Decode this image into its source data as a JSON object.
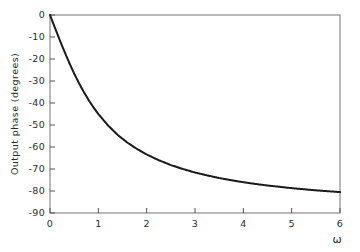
{
  "chart_data": {
    "type": "line",
    "title": "",
    "subtitle": "",
    "xlabel": "ω",
    "ylabel": "Output phase (degrees)",
    "xlim": [
      0,
      6
    ],
    "ylim": [
      -90,
      0
    ],
    "grid": false,
    "legend": null,
    "annotations": [],
    "x_ticks": [
      0,
      1,
      2,
      3,
      4,
      5,
      6
    ],
    "x_tick_labels": [
      "0",
      "1",
      "2",
      "3",
      "4",
      "5",
      "6"
    ],
    "y_ticks": [
      0,
      -10,
      -20,
      -30,
      -40,
      -50,
      -60,
      -70,
      -80,
      -90
    ],
    "y_tick_labels": [
      "0",
      "-10",
      "-20",
      "-30",
      "-40",
      "-50",
      "-60",
      "-70",
      "-80",
      "-90"
    ],
    "series": [
      {
        "name": "phase",
        "color": "#1a1a1a",
        "line_width": 2.0,
        "x": [
          0,
          0.1,
          0.2,
          0.3,
          0.4,
          0.5,
          0.6,
          0.7,
          0.8,
          0.9,
          1.0,
          1.2,
          1.4,
          1.6,
          1.8,
          2.0,
          2.25,
          2.5,
          2.75,
          3.0,
          3.25,
          3.5,
          3.75,
          4.0,
          4.25,
          4.5,
          4.75,
          5.0,
          5.25,
          5.5,
          5.75,
          6.0
        ],
        "values": [
          0,
          -5.7,
          -11.3,
          -16.7,
          -21.8,
          -26.6,
          -31.0,
          -35.0,
          -38.7,
          -42.0,
          -45.0,
          -50.2,
          -54.5,
          -58.0,
          -60.9,
          -63.4,
          -66.0,
          -68.2,
          -70.0,
          -71.6,
          -72.9,
          -74.1,
          -75.1,
          -76.0,
          -76.8,
          -77.5,
          -78.1,
          -78.7,
          -79.2,
          -79.7,
          -80.1,
          -80.5
        ]
      }
    ]
  },
  "figure": {
    "frame_color": "#8a8a8a",
    "tick_color": "#555555",
    "text_color": "#2b2b2b",
    "background": "#ffffff"
  }
}
